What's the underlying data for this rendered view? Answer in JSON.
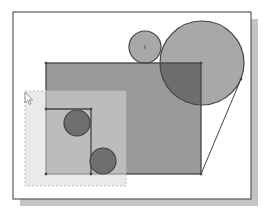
{
  "canvas": {
    "width": 269,
    "height": 218,
    "background": "#ffffff"
  },
  "colors": {
    "frame_stroke": "#5a5a5a",
    "frame_fill": "#ffffff",
    "shadow": "#c4c4c4",
    "region_fill": "#9a9a9a",
    "overlap_fill": "#6e6e6e",
    "circle_light_fill": "#a8a8a8",
    "circle_dark_fill": "#6f6f6f",
    "line_stroke": "#444444",
    "selection_fill": "#d9d9d9",
    "selection_stroke": "#bcbcbc",
    "cursor_stroke": "#777777"
  },
  "frame": {
    "x": 13,
    "y": 12,
    "w": 238,
    "h": 187,
    "shadow_offset": 7
  },
  "selection_window": {
    "x": 25,
    "y": 91,
    "w": 101,
    "h": 95
  },
  "shapes": {
    "main_rectangle": {
      "x": 46,
      "y": 63,
      "w": 155,
      "h": 111
    },
    "inner_rectangle": {
      "x": 46,
      "y": 109,
      "w": 45,
      "h": 65
    },
    "small_top_circle": {
      "cx": 145,
      "cy": 47,
      "r": 16
    },
    "large_circle": {
      "cx": 202,
      "cy": 63,
      "r": 42
    },
    "inner_circle_upper": {
      "cx": 77,
      "cy": 123,
      "r": 13
    },
    "inner_circle_lower": {
      "cx": 103,
      "cy": 161,
      "r": 13
    },
    "tangent_line": {
      "x1": 241,
      "y1": 79,
      "x2": 201,
      "y2": 174
    }
  },
  "cursor": {
    "x": 25,
    "y": 92,
    "icon": "arrow-pointer-icon"
  }
}
